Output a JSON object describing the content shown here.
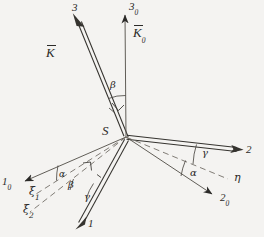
{
  "figure": {
    "type": "technical-vector-diagram",
    "background_color": "#f4f3f1",
    "ink_color": "#2b2a28"
  },
  "origin": {
    "label": "S",
    "x": 126,
    "y": 137
  },
  "axes": [
    {
      "name": "axis-3",
      "label": "3",
      "subscript": "",
      "style": "double-line",
      "from": [
        126,
        137
      ],
      "to": [
        78,
        18
      ],
      "label_pos": [
        72,
        4
      ]
    },
    {
      "name": "axis-3-zero",
      "label": "3",
      "subscript": "0",
      "style": "single-line",
      "from": [
        126,
        137
      ],
      "to": [
        125,
        10
      ],
      "label_pos": [
        129,
        2
      ]
    },
    {
      "name": "axis-2",
      "label": "2",
      "subscript": "",
      "style": "double-line",
      "from": [
        126,
        137
      ],
      "to": [
        243,
        150
      ],
      "label_pos": [
        246,
        147
      ]
    },
    {
      "name": "axis-2-zero",
      "label": "2",
      "subscript": "0",
      "style": "single-line",
      "from": [
        126,
        137
      ],
      "to": [
        218,
        198
      ],
      "label_pos": [
        221,
        196
      ]
    },
    {
      "name": "axis-1",
      "label": "1",
      "subscript": "",
      "style": "double-line",
      "from": [
        126,
        137
      ],
      "to": [
        76,
        228
      ],
      "label_pos": [
        82,
        222
      ]
    },
    {
      "name": "axis-1-zero",
      "label": "1",
      "subscript": "0",
      "style": "single-line",
      "from": [
        126,
        137
      ],
      "to": [
        18,
        184
      ],
      "label_pos": [
        3,
        180
      ]
    }
  ],
  "vectors": [
    {
      "name": "vector-K",
      "label": "K",
      "subscript": "",
      "overbar": true,
      "label_pos": [
        48,
        48
      ]
    },
    {
      "name": "vector-K-zero",
      "label": "K",
      "subscript": "0",
      "overbar": true,
      "label_pos": [
        135,
        27
      ]
    }
  ],
  "auxiliary_lines": [
    {
      "name": "line-xi-1",
      "label": "ξ",
      "subscript": "1",
      "style": "dashed",
      "from": [
        126,
        137
      ],
      "to": [
        33,
        196
      ],
      "label_pos": [
        31,
        190
      ]
    },
    {
      "name": "line-xi-2",
      "label": "ξ",
      "subscript": "2",
      "style": "dashed",
      "from": [
        126,
        137
      ],
      "to": [
        27,
        214
      ],
      "label_pos": [
        25,
        208
      ]
    },
    {
      "name": "line-eta",
      "label": "η",
      "subscript": "",
      "style": "dashed",
      "from": [
        126,
        137
      ],
      "to": [
        230,
        180
      ],
      "label_pos": [
        235,
        176
      ]
    }
  ],
  "angles": [
    {
      "name": "angle-beta-upper",
      "label": "β",
      "label_pos": [
        112,
        85
      ],
      "between": [
        "vector-K",
        "axis-3-zero"
      ]
    },
    {
      "name": "angle-gamma-right",
      "label": "γ",
      "label_pos": [
        203,
        152
      ],
      "between": [
        "axis-2",
        "line-eta"
      ]
    },
    {
      "name": "angle-alpha-right",
      "label": "α",
      "label_pos": [
        191,
        172
      ],
      "between": [
        "line-eta",
        "axis-2-zero"
      ]
    },
    {
      "name": "angle-alpha-left",
      "label": "α",
      "label_pos": [
        61,
        174
      ],
      "between": [
        "axis-1-zero",
        "line-xi-1"
      ]
    },
    {
      "name": "angle-beta-lower",
      "label": "β",
      "label_pos": [
        70,
        184
      ],
      "between": [
        "line-xi-1",
        "line-xi-2"
      ]
    },
    {
      "name": "angle-gamma-lower",
      "label": "γ",
      "label_pos": [
        84,
        196
      ],
      "between": [
        "line-xi-2",
        "axis-1"
      ]
    }
  ],
  "markers": [
    {
      "name": "right-angle-marker-upper",
      "type": "right-angle",
      "pos": [
        114,
        107
      ]
    },
    {
      "name": "right-angle-marker-lower",
      "type": "right-angle",
      "pos": [
        88,
        168
      ]
    }
  ]
}
